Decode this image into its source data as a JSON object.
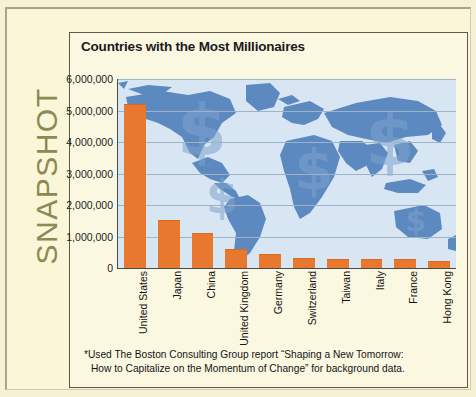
{
  "publication": {
    "section_label": "SNAPSHOT"
  },
  "panel": {
    "title": "Countries with the Most Millionaires",
    "footnote_line1": "*Used The Boston Consulting Group report “Shaping a New Tomorrow:",
    "footnote_line2": "How to  Capitalize on the Momentum of Change” for background data."
  },
  "colors": {
    "bar": "#e8782e",
    "map_land": "#5b89c0",
    "map_ocean": "#d8e6f4",
    "page_background": "#faf6d8",
    "snapshot_text": "#8e8853",
    "gridline": "#9fb3c6",
    "axis": "#4a4a4a"
  },
  "chart_data": {
    "type": "bar",
    "title": "Countries with the Most Millionaires",
    "xlabel": "",
    "ylabel": "",
    "ylim": [
      0,
      6000000
    ],
    "grid": true,
    "legend": null,
    "categories": [
      "United States",
      "Japan",
      "China",
      "United Kingdom",
      "Germany",
      "Switzerland",
      "Taiwan",
      "Italy",
      "France",
      "Hong Kong"
    ],
    "values": [
      5200000,
      1520000,
      1110000,
      610000,
      430000,
      330000,
      300000,
      290000,
      280000,
      210000
    ],
    "ytick_labels": [
      "6,000,000",
      "5,000,000",
      "4,000,000",
      "3,000,000",
      "2,000,000",
      "1,000,000",
      "0"
    ],
    "ytick_values": [
      6000000,
      5000000,
      4000000,
      3000000,
      2000000,
      1000000,
      0
    ],
    "background_image": "world-map-with-dollar-signs"
  }
}
